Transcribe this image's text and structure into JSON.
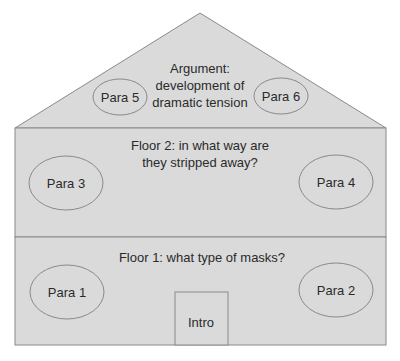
{
  "colors": {
    "fill": "#dadada",
    "stroke": "#8a8a8a",
    "text": "#2a2a2a",
    "background": "#ffffff"
  },
  "roof": {
    "title_lines": [
      "Argument:",
      "development of",
      "dramatic tension"
    ],
    "left_oval": "Para 5",
    "right_oval": "Para 6"
  },
  "floor2": {
    "title_lines": [
      "Floor 2: in what way are",
      "they stripped away?"
    ],
    "left_oval": "Para 3",
    "right_oval": "Para 4"
  },
  "floor1": {
    "title": "Floor 1: what type of masks?",
    "left_oval": "Para 1",
    "right_oval": "Para 2",
    "door": "Intro"
  }
}
